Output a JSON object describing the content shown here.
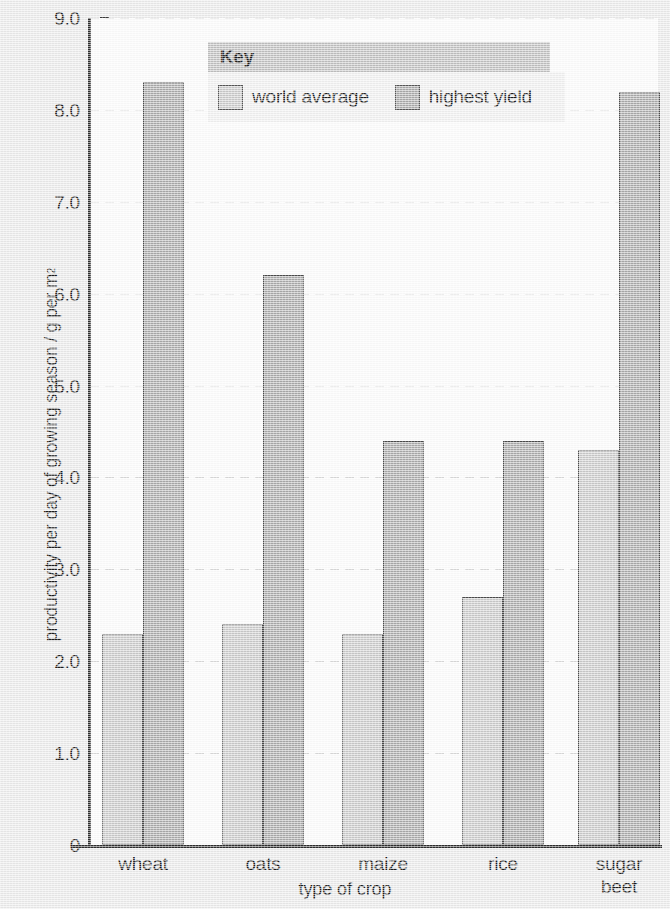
{
  "chart_data": {
    "type": "bar",
    "title": "",
    "xlabel": "type of crop",
    "ylabel": "productivity per day of growing season / g per m",
    "ylabel_sup": "2",
    "categories": [
      "wheat",
      "oats",
      "maize",
      "rice",
      "sugar beet"
    ],
    "category_lines": [
      [
        "wheat"
      ],
      [
        "oats"
      ],
      [
        "maize"
      ],
      [
        "rice"
      ],
      [
        "sugar",
        "beet"
      ]
    ],
    "series": [
      {
        "name": "world average",
        "values": [
          2.3,
          2.4,
          2.3,
          2.7,
          4.3
        ],
        "color": "#c8c8c8"
      },
      {
        "name": "highest yield",
        "values": [
          8.3,
          6.2,
          4.4,
          4.4,
          8.2
        ],
        "color": "#a8a8a8"
      }
    ],
    "ylim": [
      0,
      9.0
    ],
    "yticks": [
      "0",
      "1.0",
      "2.0",
      "3.0",
      "4.0",
      "5.0",
      "6.0",
      "7.0",
      "8.0",
      "9.0"
    ],
    "ytick_values": [
      0,
      1.0,
      2.0,
      3.0,
      4.0,
      5.0,
      6.0,
      7.0,
      8.0,
      9.0
    ],
    "grid": true,
    "grid_style": "dashed-horizontal",
    "legend_position": "top-center",
    "legend_title": "Key"
  },
  "legend": {
    "title": "Key",
    "entries": [
      {
        "label": "world average",
        "swatch": "light"
      },
      {
        "label": "highest yield",
        "swatch": "dark"
      }
    ]
  },
  "colors": {
    "page_background": "#e9e9e9",
    "plot_background": "#fbfbfb",
    "axis": "#2d2d2d",
    "gridline": "#d8d8d8",
    "bar_light": "#c8c8c8",
    "bar_dark": "#a8a8a8",
    "bar_border": "#4a4a4a",
    "legend_title_background": "#bdbdbd",
    "legend_body_background": "#efefef",
    "text": "#1b1b1b"
  }
}
